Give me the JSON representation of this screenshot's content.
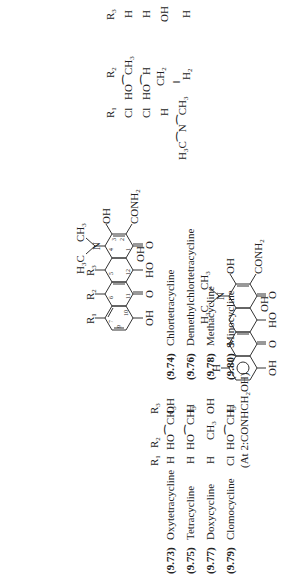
{
  "figure": {
    "type": "chemical-structure-diagram",
    "orientation": "rotated 90 degrees (text reads bottom-to-top)",
    "core_structure": {
      "substituent_labels": [
        "R1",
        "R2",
        "R3"
      ],
      "groups": [
        "OH",
        "OH",
        "CONH2",
        "O",
        "OH",
        "HO",
        "O",
        "OH",
        "H3C",
        "CH3",
        "N"
      ],
      "ring_numbers": [
        "1",
        "2",
        "3",
        "4",
        "5",
        "6",
        "7",
        "8",
        "9",
        "10",
        "11",
        "12"
      ]
    },
    "left_table": {
      "headers": [
        "",
        "",
        "R1",
        "R2",
        "R3"
      ],
      "rows": [
        {
          "id": "(9.73)",
          "name": "Oxytetracycline",
          "r1": "H",
          "r2": "HO⁀CH3",
          "r3": "OH"
        },
        {
          "id": "(9.75)",
          "name": "Tetracycline",
          "r1": "H",
          "r2": "HO⁀CH3",
          "r3": "H"
        },
        {
          "id": "(9.77)",
          "name": "Doxycycline",
          "r1": "H",
          "r2": "CH3",
          "r3": "OH"
        },
        {
          "id": "(9.79)",
          "name": "Clomocycline",
          "r1": "Cl",
          "r2": "HO⁀CH3",
          "r3": "H"
        }
      ],
      "footnote": "(At 2: CONHCH2OH)"
    },
    "right_table": {
      "headers": [
        "",
        "",
        "R1",
        "R2",
        "R3"
      ],
      "rows": [
        {
          "id": "(9.74)",
          "name": "Chlortetracycline",
          "r1": "Cl",
          "r2": "HO⁀CH3",
          "r3": "H"
        },
        {
          "id": "(9.76)",
          "name": "Demethylchlortetracycline",
          "r1": "Cl",
          "r2": "HO⁀H",
          "r3": "H"
        },
        {
          "id": "(9.78)",
          "name": "Methacycline",
          "r1": "H",
          "r2": "=CH2",
          "r3": "OH"
        },
        {
          "id": "(9.80)",
          "name": "Minocycline",
          "r1": "H3C–N–CH3",
          "r2": "H2",
          "r3": "H"
        }
      ]
    },
    "second_structure": {
      "description": "thia-analogue tetracycline",
      "groups": [
        "H",
        "S",
        "OH",
        "O",
        "HO",
        "OH",
        "O",
        "OH",
        "CONH2",
        "H3C",
        "CH3",
        "N"
      ]
    }
  },
  "labels": {
    "R1": "R",
    "R2": "R",
    "R3": "R",
    "s1": "1",
    "s2": "2",
    "s3": "3",
    "oxy_id": "(9.73)",
    "oxy_name": "Oxytetracycline",
    "oxy_r1": "H",
    "oxy_r3": "OH",
    "tet_id": "(9.75)",
    "tet_name": "Tetracycline",
    "tet_r1": "H",
    "tet_r3": "H",
    "dox_id": "(9.77)",
    "dox_name": "Doxycycline",
    "dox_r1": "H",
    "dox_r3": "OH",
    "clo_id": "(9.79)",
    "clo_name": "Clomocycline",
    "clo_r1": "Cl",
    "clo_r3": "H",
    "footnote": "(At 2:CONHCH",
    "footnote_end": "OH)",
    "chl_id": "(9.74)",
    "chl_name": "Chlortetracycline",
    "chl_r1": "Cl",
    "chl_r3": "H",
    "dem_id": "(9.76)",
    "dem_name": "Demethylchlortetracycline",
    "dem_r1": "Cl",
    "dem_r3": "H",
    "met_id": "(9.78)",
    "met_name": "Methacycline",
    "met_r1": "H",
    "met_r3": "OH",
    "min_id": "(9.80)",
    "min_name": "Minocycline",
    "min_r1": "H",
    "min_r3": "H",
    "HO": "HO",
    "CH": "CH",
    "OH": "OH",
    "H": "H",
    "O": "O",
    "N": "N",
    "S": "S",
    "H3C": "H",
    "C": "C",
    "CONH": "CONH",
    "two": "2",
    "three": "3"
  }
}
